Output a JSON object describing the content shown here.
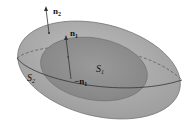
{
  "diagram": {
    "outer_surface": {
      "label": "S",
      "subscript": "2",
      "fill": "#a9a9a9"
    },
    "inner_surface": {
      "label": "S",
      "subscript": "1",
      "fill": "#8f8f8f"
    },
    "vectors": [
      {
        "label": "n",
        "subscript": "2",
        "description": "outward normal on outer surface"
      },
      {
        "label": "n",
        "subscript": "1",
        "description": "normal on inner surface"
      },
      {
        "label": "−n",
        "subscript": "1",
        "description": "inward normal on inner surface"
      }
    ],
    "line_color": "#333333"
  }
}
